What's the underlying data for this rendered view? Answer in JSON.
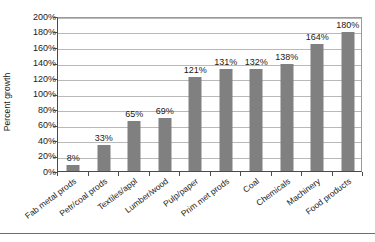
{
  "chart_data": {
    "type": "bar",
    "title": "",
    "xlabel": "",
    "ylabel": "Percent growth",
    "ylim": [
      0,
      200
    ],
    "ytick_labels": [
      "200%",
      "180%",
      "160%",
      "140%",
      "120%",
      "100%",
      "80%",
      "60%",
      "40%",
      "20%",
      "0%"
    ],
    "ytick_values": [
      200,
      180,
      160,
      140,
      120,
      100,
      80,
      60,
      40,
      20,
      0
    ],
    "grid": true,
    "legend": "none",
    "bar_color": "#808080",
    "categories": [
      "Fab metal prods",
      "Petr/coal prods",
      "Textiles/appl",
      "Lumber/wood",
      "Pulp/paper",
      "Prim met prods",
      "Coal",
      "Chemicals",
      "Machinery",
      "Food products"
    ],
    "values": [
      8,
      33,
      65,
      69,
      121,
      131,
      132,
      138,
      164,
      180
    ],
    "data_labels": [
      "8%",
      "33%",
      "65%",
      "69%",
      "121%",
      "131%",
      "132%",
      "138%",
      "164%",
      "180%"
    ]
  }
}
